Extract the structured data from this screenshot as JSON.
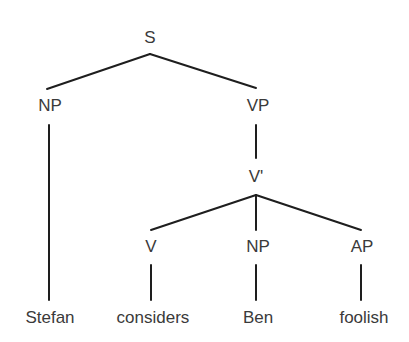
{
  "diagram": {
    "type": "syntax-tree",
    "nodes": {
      "s": "S",
      "np_subject": "NP",
      "vp": "VP",
      "v_bar": "V'",
      "v": "V",
      "np_object": "NP",
      "ap": "AP"
    },
    "leaves": {
      "stefan": "Stefan",
      "considers": "considers",
      "ben": "Ben",
      "foolish": "foolish"
    },
    "edges": [
      [
        "S",
        "NP"
      ],
      [
        "S",
        "VP"
      ],
      [
        "NP",
        "Stefan"
      ],
      [
        "VP",
        "V'"
      ],
      [
        "V'",
        "V"
      ],
      [
        "V'",
        "NP"
      ],
      [
        "V'",
        "AP"
      ],
      [
        "V",
        "considers"
      ],
      [
        "NP",
        "Ben"
      ],
      [
        "AP",
        "foolish"
      ]
    ],
    "colors": {
      "line": "#1e1e1e",
      "text": "#3a3a3a",
      "background": "#ffffff"
    }
  }
}
